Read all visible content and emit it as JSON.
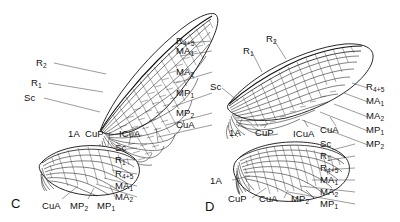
{
  "figure": {
    "type": "scientific-line-drawing",
    "background_color": "#ffffff",
    "ink_color": "#111111",
    "panels": [
      {
        "letter": "C",
        "wings": [
          {
            "wing_name": "forewing",
            "labels_left": [
              "R2",
              "R1",
              "Sc"
            ],
            "labels_right": [
              "R4+5",
              "MA1",
              "MA2",
              "MP1",
              "MP2",
              "CuA"
            ],
            "labels_below": [
              "1A",
              "CuP",
              "ICuA"
            ]
          },
          {
            "wing_name": "hindwing",
            "labels_right": [
              "Sc",
              "R1",
              "R4+5",
              "MA1",
              "MA2"
            ],
            "labels_below": [
              "CuA",
              "MP2",
              "MP1"
            ]
          }
        ]
      },
      {
        "letter": "D",
        "wings": [
          {
            "wing_name": "forewing",
            "labels_left": [
              "R2",
              "R1",
              "Sc"
            ],
            "labels_right": [
              "R4+5",
              "MA1",
              "MA2",
              "MP1",
              "MP2"
            ],
            "labels_below": [
              "1A",
              "CuP",
              "ICuA",
              "CuA"
            ]
          },
          {
            "wing_name": "hindwing",
            "labels_right": [
              "Sc",
              "R1",
              "R4+5",
              "MA1",
              "MA2",
              "MP1"
            ],
            "labels_left": [
              "1A"
            ],
            "labels_below": [
              "CuP",
              "CuA",
              "MP2"
            ]
          }
        ]
      }
    ]
  },
  "labels": {
    "c_fw_r2": "R2",
    "c_fw_r1": "R1",
    "c_fw_sc": "Sc",
    "c_fw_r45": "R4+5",
    "c_fw_ma1": "MA1",
    "c_fw_ma2": "MA2",
    "c_fw_mp1": "MP1",
    "c_fw_mp2": "MP2",
    "c_fw_cua": "CuA",
    "c_fw_1a": "1A",
    "c_fw_cup": "CuP",
    "c_fw_icua": "ICuA",
    "c_hw_sc": "Sc",
    "c_hw_r1": "R1",
    "c_hw_r45": "R4+5",
    "c_hw_ma1": "MA1",
    "c_hw_ma2": "MA2",
    "c_hw_cua": "CuA",
    "c_hw_mp2": "MP2",
    "c_hw_mp1": "MP1",
    "panel_c": "C",
    "d_fw_r2": "R2",
    "d_fw_r1": "R1",
    "d_fw_sc": "Sc",
    "d_fw_r45": "R4+5",
    "d_fw_ma1": "MA1",
    "d_fw_ma2": "MA2",
    "d_fw_mp1": "MP1",
    "d_fw_mp2": "MP2",
    "d_fw_1a": "1A",
    "d_fw_cup": "CuP",
    "d_fw_icua": "ICuA",
    "d_fw_cua": "CuA",
    "d_hw_sc": "Sc",
    "d_hw_r1": "R1",
    "d_hw_r45": "R4+5",
    "d_hw_ma1": "MA1",
    "d_hw_ma2": "MA2",
    "d_hw_mp1": "MP1",
    "d_hw_1a": "1A",
    "d_hw_cup": "CuP",
    "d_hw_cua": "CuA",
    "d_hw_mp2": "MP2",
    "panel_d": "D"
  }
}
